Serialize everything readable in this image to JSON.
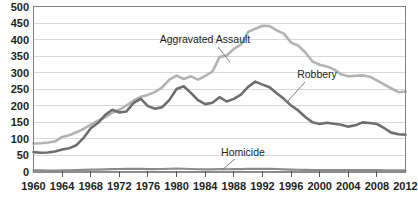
{
  "chart_data": {
    "type": "line",
    "title": "",
    "subtitle": "",
    "xlabel": "",
    "ylabel": "",
    "xlim": [
      1960,
      2012
    ],
    "ylim": [
      0,
      500
    ],
    "grid": true,
    "legend_position": "inline-annotations",
    "yticks": [
      0,
      50,
      100,
      150,
      200,
      250,
      300,
      350,
      400,
      450,
      500
    ],
    "ytick_labels": [
      "0",
      "50",
      "100",
      "150",
      "200",
      "250",
      "300",
      "350",
      "400",
      "450",
      "500"
    ],
    "xticks": [
      1960,
      1964,
      1968,
      1972,
      1976,
      1980,
      1984,
      1988,
      1992,
      1996,
      2000,
      2004,
      2008,
      2012
    ],
    "xtick_labels": [
      "1960",
      "1964",
      "1968",
      "1972",
      "1976",
      "1980",
      "1984",
      "1988",
      "1992",
      "1996",
      "2000",
      "2004",
      "2008",
      "2012"
    ],
    "x": [
      1960,
      1961,
      1962,
      1963,
      1964,
      1965,
      1966,
      1967,
      1968,
      1969,
      1970,
      1971,
      1972,
      1973,
      1974,
      1975,
      1976,
      1977,
      1978,
      1979,
      1980,
      1981,
      1982,
      1983,
      1984,
      1985,
      1986,
      1987,
      1988,
      1989,
      1990,
      1991,
      1992,
      1993,
      1994,
      1995,
      1996,
      1997,
      1998,
      1999,
      2000,
      2001,
      2002,
      2003,
      2004,
      2005,
      2006,
      2007,
      2008,
      2009,
      2010,
      2011,
      2012
    ],
    "series": [
      {
        "name": "Aggravated Assault",
        "color": "#b3b3b3",
        "values": [
          86,
          87,
          89,
          92,
          106,
          111,
          120,
          130,
          143,
          155,
          165,
          179,
          188,
          201,
          216,
          227,
          233,
          242,
          256,
          279,
          291,
          281,
          289,
          279,
          290,
          303,
          347,
          352,
          372,
          385,
          423,
          433,
          442,
          441,
          428,
          418,
          391,
          382,
          361,
          334,
          324,
          319,
          310,
          295,
          289,
          291,
          292,
          288,
          277,
          265,
          253,
          241,
          243
        ]
      },
      {
        "name": "Robbery",
        "color": "#6e6e6e",
        "values": [
          60,
          58,
          59,
          62,
          68,
          72,
          81,
          103,
          132,
          148,
          172,
          188,
          180,
          183,
          209,
          221,
          199,
          191,
          196,
          218,
          251,
          259,
          239,
          217,
          205,
          209,
          226,
          213,
          221,
          234,
          257,
          273,
          264,
          256,
          238,
          221,
          201,
          186,
          166,
          150,
          145,
          149,
          146,
          143,
          137,
          141,
          150,
          148,
          145,
          133,
          119,
          114,
          113
        ]
      },
      {
        "name": "Homicide",
        "color": "#8c8c8c",
        "values": [
          5.1,
          4.8,
          4.6,
          4.6,
          4.9,
          5.1,
          5.6,
          6.2,
          6.9,
          7.3,
          7.9,
          8.6,
          9.0,
          9.4,
          9.8,
          9.6,
          8.8,
          8.8,
          9.0,
          9.8,
          10.2,
          9.8,
          9.1,
          8.3,
          7.9,
          8.0,
          8.6,
          8.3,
          8.5,
          8.7,
          9.4,
          9.8,
          9.3,
          9.5,
          9.0,
          8.2,
          7.4,
          6.8,
          6.3,
          5.7,
          5.5,
          5.6,
          5.6,
          5.7,
          5.5,
          5.6,
          5.8,
          5.7,
          5.4,
          5.0,
          4.8,
          4.7,
          4.7
        ]
      }
    ],
    "annotations": [
      {
        "label": "Aggravated Assault",
        "series": "Aggravated Assault"
      },
      {
        "label": "Robbery",
        "series": "Robbery"
      },
      {
        "label": "Homicide",
        "series": "Homicide"
      }
    ]
  }
}
